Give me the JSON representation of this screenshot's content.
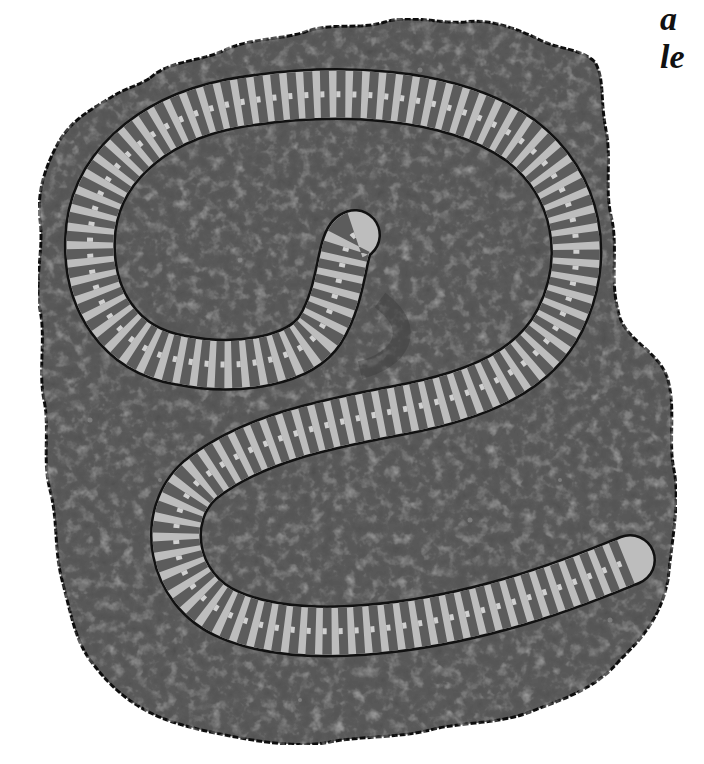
{
  "caption": {
    "line1": "a",
    "line2": "le"
  },
  "illustration": {
    "subject": "earthworm-on-soil",
    "colors": {
      "soil": "#5a5a5a",
      "soil_dark": "#474747",
      "soil_speck": "#8a8a8a",
      "outline": "#111111",
      "worm_light": "#c9c9c9",
      "worm_band": "#5c5c5c"
    }
  }
}
